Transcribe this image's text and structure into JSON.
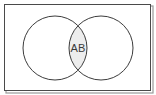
{
  "figure": {
    "type": "venn-diagram",
    "title": "",
    "background_color": "#ffffff",
    "frame": {
      "name": "universal-set-rectangle",
      "x": 4,
      "y": 4,
      "width": 147,
      "height": 87,
      "stroke_color": "#4a4a4a",
      "stroke_width": 1,
      "fill_color": "#ffffff",
      "shadow_color": "#9a9a9a"
    },
    "circles": [
      {
        "name": "set-a-circle",
        "label": "A",
        "cx": 55,
        "cy": 48,
        "r": 32,
        "stroke_color": "#3c3c3c",
        "stroke_width": 1,
        "fill_color": "none"
      },
      {
        "name": "set-b-circle",
        "label": "B",
        "cx": 101,
        "cy": 48,
        "r": 32,
        "stroke_color": "#3c3c3c",
        "stroke_width": 1,
        "fill_color": "none"
      }
    ],
    "intersection": {
      "name": "intersection-region",
      "label": "AB",
      "fill_color": "#ededed",
      "stroke_color": "#3c3c3c",
      "text_color": "#3a3a3a",
      "text_x": 78,
      "text_y": 52
    }
  }
}
